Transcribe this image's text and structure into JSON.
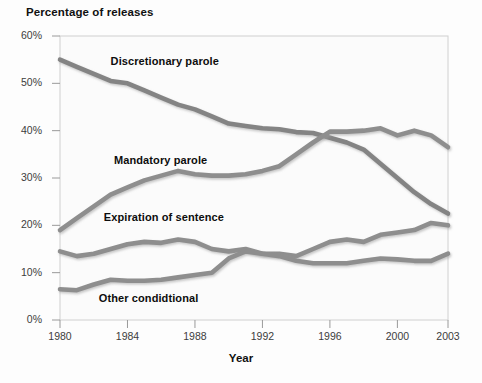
{
  "chart_data": {
    "type": "line",
    "title": "Percentage of releases",
    "subtitle": "",
    "xlabel": "Year",
    "ylabel": "",
    "xlim": [
      1980,
      2003
    ],
    "ylim": [
      0,
      60
    ],
    "grid": false,
    "legend_position": "inline-annotations",
    "x": [
      1980,
      1981,
      1982,
      1983,
      1984,
      1985,
      1986,
      1987,
      1988,
      1989,
      1990,
      1991,
      1992,
      1993,
      1994,
      1995,
      1996,
      1997,
      1998,
      1999,
      2000,
      2001,
      2002,
      2003
    ],
    "xticks": [
      1980,
      1984,
      1988,
      1992,
      1996,
      2000,
      2003
    ],
    "xticklabels": [
      "1980",
      "1984",
      "1988",
      "1992",
      "1996",
      "2000",
      "2003"
    ],
    "yticks": [
      0,
      10,
      20,
      30,
      40,
      50,
      60
    ],
    "yticklabels": [
      "0%",
      "10%",
      "20%",
      "30%",
      "40%",
      "50%",
      "60%"
    ],
    "series": [
      {
        "name": "Discretionary parole",
        "color": "#848484",
        "label_x": 1983.0,
        "label_y": 54.5,
        "values": [
          55.0,
          53.5,
          52.0,
          50.5,
          50.0,
          48.5,
          47.0,
          45.5,
          44.5,
          43.0,
          41.5,
          41.0,
          40.5,
          40.3,
          39.7,
          39.5,
          38.5,
          37.5,
          36.0,
          33.0,
          30.0,
          27.0,
          24.5,
          22.5
        ]
      },
      {
        "name": "Mandatory parole",
        "color": "#8e8e8e",
        "label_x": 1983.2,
        "label_y": 33.5,
        "values": [
          19.0,
          21.5,
          24.0,
          26.5,
          28.0,
          29.5,
          30.5,
          31.5,
          30.8,
          30.5,
          30.5,
          30.8,
          31.5,
          32.5,
          35.0,
          37.5,
          39.8,
          39.8,
          40.0,
          40.5,
          39.0,
          40.0,
          39.0,
          36.5
        ]
      },
      {
        "name": "Expiration of sentence",
        "color": "#8e8e8e",
        "label_x": 1982.6,
        "label_y": 21.5,
        "values": [
          14.5,
          13.5,
          14.0,
          15.0,
          16.0,
          16.5,
          16.3,
          17.0,
          16.5,
          15.0,
          14.5,
          15.0,
          14.0,
          14.0,
          13.5,
          15.0,
          16.5,
          17.0,
          16.5,
          18.0,
          18.5,
          19.0,
          20.5,
          20.0
        ]
      },
      {
        "name": "Other condidtional",
        "color": "#8e8e8e",
        "label_x": 1982.3,
        "label_y": 4.5,
        "values": [
          6.5,
          6.3,
          7.5,
          8.5,
          8.3,
          8.3,
          8.5,
          9.0,
          9.5,
          10.0,
          13.0,
          14.5,
          14.0,
          13.5,
          12.5,
          12.0,
          12.0,
          12.0,
          12.5,
          13.0,
          12.8,
          12.5,
          12.5,
          14.0
        ]
      }
    ]
  },
  "axes": {
    "frame_color": "#d0d0d0",
    "tick_color": "#9a9a9a",
    "text_color": "#3c3c3c"
  }
}
